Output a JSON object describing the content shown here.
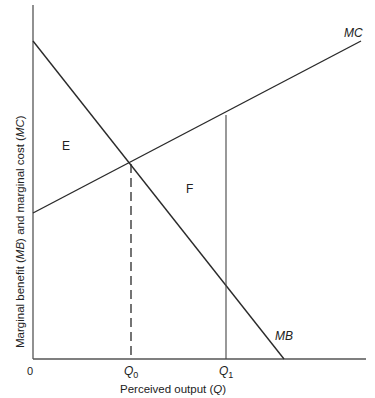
{
  "diagram": {
    "type": "economics-marginal-analysis",
    "axes": {
      "x_label_prefix": "Perceived output (",
      "x_label_var": "Q",
      "x_label_suffix": ")",
      "y_label_part1": "Marginal benefit (",
      "y_label_var1": "MB",
      "y_label_part2": ") and marginal cost (",
      "y_label_var2": "MC",
      "y_label_part3": ")",
      "origin_label": "0"
    },
    "curves": {
      "mc": {
        "label": "MC",
        "start": [
          33,
          213
        ],
        "end": [
          361,
          41
        ]
      },
      "mb": {
        "label": "MB",
        "start": [
          33,
          41
        ],
        "end": [
          284,
          359
        ]
      }
    },
    "ticks": {
      "q0": {
        "label": "Q",
        "sub": "0",
        "x": 131
      },
      "q1": {
        "label": "Q",
        "sub": "1",
        "x": 226
      }
    },
    "regions": {
      "e": {
        "label": "E"
      },
      "f": {
        "label": "F"
      }
    },
    "colors": {
      "line": "#2a2a2a",
      "axis": "#555555",
      "background": "#ffffff"
    }
  }
}
